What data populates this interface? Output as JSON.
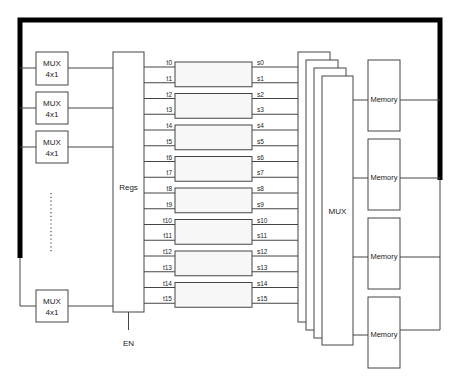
{
  "diagram": {
    "title": "",
    "input_muxes": [
      {
        "id": "mux-in-0",
        "line1": "MUX",
        "line2": "4x1"
      },
      {
        "id": "mux-in-1",
        "line1": "MUX",
        "line2": "4x1"
      },
      {
        "id": "mux-in-2",
        "line1": "MUX",
        "line2": "4x1"
      },
      {
        "id": "mux-in-n",
        "line1": "MUX",
        "line2": "4x1"
      }
    ],
    "ellipsis": "⋮",
    "registers": {
      "label": "Regs",
      "enable_label": "EN"
    },
    "t_labels": [
      "t0",
      "t1",
      "t2",
      "t3",
      "t4",
      "t5",
      "t6",
      "t7",
      "t8",
      "t9",
      "t10",
      "t11",
      "t12",
      "t13",
      "t14",
      "t15"
    ],
    "s_labels": [
      "s0",
      "s1",
      "s2",
      "s3",
      "s4",
      "s5",
      "s6",
      "s7",
      "s8",
      "s9",
      "s10",
      "s11",
      "s12",
      "s13",
      "s14",
      "s15"
    ],
    "processing_blocks": 8,
    "output_mux": {
      "label": "MUX",
      "stack_count": 4
    },
    "memories": [
      {
        "label": "Memory"
      },
      {
        "label": "Memory"
      },
      {
        "label": "Memory"
      },
      {
        "label": "Memory"
      }
    ],
    "colors": {
      "line": "#444444",
      "bus": "#000000",
      "block_fill": "#f7f7f7"
    }
  }
}
